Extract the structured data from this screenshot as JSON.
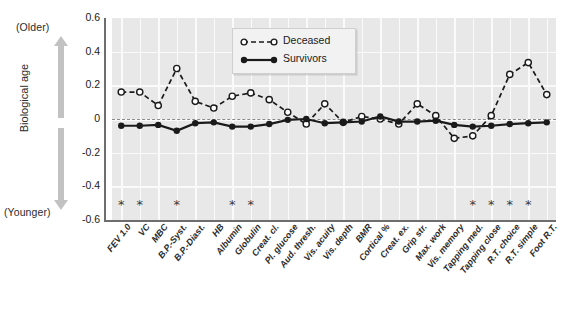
{
  "figure": {
    "axis_title": "Biological age",
    "older_label": "(Older)",
    "younger_label": "(Younger)",
    "arrow_up_name": "older-arrow",
    "arrow_down_name": "younger-arrow"
  },
  "legend": {
    "position": "top-center-right",
    "entries": [
      {
        "label": "Deceased",
        "marker": "open-circle",
        "line": "dashed",
        "color": "#1a1a1a"
      },
      {
        "label": "Survivors",
        "marker": "filled-circle",
        "line": "solid",
        "color": "#1a1a1a"
      }
    ]
  },
  "colors": {
    "plot_background": "#e8e8e8",
    "gridline": "#fafafa",
    "zero_line": "#8a8a8a",
    "axis": "#6e6e6e",
    "series": "#1a1a1a",
    "arrow": "#c2c2c2",
    "asterisk": "#3a3a3a"
  },
  "chart_data": {
    "type": "line",
    "title": "",
    "xlabel": "",
    "ylabel": "Biological age",
    "ylim": [
      -0.6,
      0.6
    ],
    "yticks": [
      0.6,
      0.4,
      0.2,
      0,
      -0.2,
      -0.4,
      -0.6
    ],
    "ytick_labels": [
      "0.6",
      "0.4",
      "0.2",
      "0",
      "-0.2",
      "-0.4",
      "-0.6"
    ],
    "grid": true,
    "zero_reference_line": 0,
    "legend_position": "upper center",
    "categories": [
      "FEV 1.0",
      "VC",
      "MBC",
      "B.P.-Syst.",
      "B.P.-Diast.",
      "HB",
      "Albumin",
      "Globulin",
      "Creat. cl.",
      "Pl. glucose",
      "Aud. thresh.",
      "Vis. acuity",
      "Vis. depth",
      "BMR",
      "Cortical %",
      "Creat. ex.",
      "Grip str.",
      "Max. work",
      "Vis. memory",
      "Tapping med.",
      "Tapping close",
      "R.T. choice",
      "R.T. simple",
      "Foot R.T."
    ],
    "series": [
      {
        "name": "Deceased",
        "marker": "open-circle",
        "linestyle": "dashed",
        "values": [
          0.16,
          0.16,
          0.08,
          0.3,
          0.105,
          0.065,
          0.135,
          0.155,
          0.115,
          0.04,
          -0.03,
          0.09,
          -0.02,
          0.015,
          0.0,
          -0.03,
          0.09,
          0.02,
          -0.115,
          -0.1,
          0.02,
          0.265,
          0.335,
          0.145
        ]
      },
      {
        "name": "Survivors",
        "marker": "filled-circle",
        "linestyle": "solid",
        "values": [
          -0.04,
          -0.04,
          -0.035,
          -0.07,
          -0.025,
          -0.02,
          -0.045,
          -0.045,
          -0.03,
          -0.005,
          0.0,
          -0.025,
          -0.02,
          -0.015,
          0.015,
          -0.015,
          -0.015,
          -0.01,
          -0.035,
          -0.045,
          -0.04,
          -0.03,
          -0.025,
          -0.02
        ]
      }
    ],
    "significance_markers": {
      "symbol": "*",
      "y_position": -0.505,
      "categories": [
        "FEV 1.0",
        "VC",
        "B.P.-Syst.",
        "Albumin",
        "Globulin",
        "Tapping med.",
        "Tapping close",
        "R.T. choice",
        "R.T. simple"
      ]
    }
  }
}
